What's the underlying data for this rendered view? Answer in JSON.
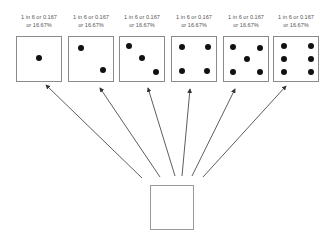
{
  "diagram": {
    "outcomes": [
      {
        "face": 1,
        "label_line1": "1 in 6 or 0.167",
        "label_line2": "or 16.67%"
      },
      {
        "face": 2,
        "label_line1": "1 in 6 or 0.167",
        "label_line2": "or 16.67%"
      },
      {
        "face": 3,
        "label_line1": "1 in 6 or 0.167",
        "label_line2": "or 16.67%"
      },
      {
        "face": 4,
        "label_line1": "1 in 6 or 0.167",
        "label_line2": "or 16.67%"
      },
      {
        "face": 5,
        "label_line1": "1 in 6 or 0.167",
        "label_line2": "or 16.67%"
      },
      {
        "face": 6,
        "label_line1": "1 in 6 or 0.167",
        "label_line2": "or 16.67%"
      }
    ],
    "source": {
      "shape": "empty-square"
    },
    "colors": {
      "box_border": "#8a8a8a",
      "pip": "#111111",
      "arrow": "#333333",
      "text": "#555555"
    }
  }
}
